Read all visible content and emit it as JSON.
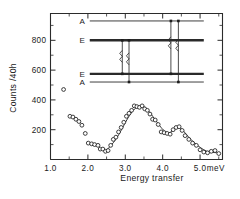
{
  "chart_data": {
    "type": "scatter",
    "title": "",
    "subtitle": "",
    "xlabel": "Energy transfer",
    "xunit": "meV",
    "ylabel": "Counts /40h",
    "xlim": [
      1.0,
      5.6
    ],
    "ylim": [
      0,
      980
    ],
    "grid": false,
    "legend_position": "none",
    "xticks": [
      1.0,
      2.0,
      3.0,
      4.0,
      5.0
    ],
    "xticklabels": [
      "1.0",
      "2.0",
      "3.0",
      "4.0",
      "5.0"
    ],
    "yticks": [
      200,
      400,
      600,
      800
    ],
    "yticklabels": [
      "200",
      "400",
      "600",
      "800"
    ],
    "x_minor_tick_step": 0.5,
    "y_minor_tick_step": 100,
    "series": [
      {
        "name": "Neutron counts",
        "marker": "open-circle",
        "x": [
          1.35,
          1.52,
          1.6,
          1.68,
          1.76,
          1.84,
          1.93,
          2.01,
          2.1,
          2.18,
          2.27,
          2.33,
          2.4,
          2.47,
          2.54,
          2.61,
          2.68,
          2.75,
          2.82,
          2.89,
          2.96,
          3.03,
          3.1,
          3.17,
          3.24,
          3.31,
          3.38,
          3.45,
          3.52,
          3.59,
          3.66,
          3.73,
          3.8,
          3.88,
          3.96,
          4.04,
          4.12,
          4.2,
          4.28,
          4.36,
          4.44,
          4.52,
          4.6,
          4.7,
          4.8,
          4.9,
          5.0,
          5.1,
          5.2,
          5.3,
          5.4,
          5.5
        ],
        "y": [
          470,
          290,
          285,
          270,
          255,
          230,
          175,
          110,
          105,
          100,
          95,
          70,
          70,
          55,
          60,
          95,
          135,
          150,
          185,
          215,
          250,
          290,
          310,
          330,
          360,
          355,
          350,
          360,
          340,
          330,
          305,
          270,
          265,
          235,
          185,
          180,
          175,
          170,
          200,
          215,
          220,
          195,
          160,
          135,
          110,
          95,
          65,
          50,
          45,
          55,
          60,
          40
        ]
      }
    ],
    "fit_curve": {
      "name": "Fitted profile",
      "x": [
        2.48,
        2.62,
        2.76,
        2.9,
        3.04,
        3.18,
        3.32,
        3.46,
        3.6,
        3.74,
        3.88,
        4.02,
        4.16,
        4.3,
        4.42,
        4.56,
        4.7,
        4.86,
        5.02,
        5.18,
        5.34,
        5.5
      ],
      "y": [
        58,
        95,
        140,
        200,
        265,
        320,
        352,
        358,
        332,
        288,
        240,
        198,
        178,
        200,
        218,
        190,
        148,
        110,
        78,
        55,
        48,
        44
      ]
    },
    "annotations": [
      {
        "text": "meV",
        "x": 5.42,
        "y": -140,
        "role": "x-unit"
      }
    ]
  },
  "inset": {
    "name": "energy-level-diagram",
    "levels": [
      {
        "label": "A",
        "style": "thin",
        "y_value": 930,
        "x_start": 2.05,
        "x_end": 5.1
      },
      {
        "label": "E",
        "style": "thick",
        "y_value": 800,
        "x_start": 2.05,
        "x_end": 5.1
      },
      {
        "label": "E",
        "style": "thick",
        "y_value": 575,
        "x_start": 2.05,
        "x_end": 5.1
      },
      {
        "label": "A",
        "style": "thin",
        "y_value": 520,
        "x_start": 2.05,
        "x_end": 5.1
      }
    ],
    "transitions": [
      {
        "x": 2.92,
        "from_level": 1,
        "to_level": 2,
        "marker": "squiggle"
      },
      {
        "x": 3.1,
        "from_level": 1,
        "to_level": 3,
        "marker": "squiggle"
      },
      {
        "x": 4.22,
        "from_level": 0,
        "to_level": 2,
        "marker": "squiggle"
      },
      {
        "x": 4.42,
        "from_level": 0,
        "to_level": 3,
        "marker": "squiggle"
      }
    ]
  },
  "colors": {
    "ink": "#1d1d1d",
    "axis": "#2b2b2b",
    "marker_fill": "#ffffff",
    "background": "#ffffff"
  }
}
